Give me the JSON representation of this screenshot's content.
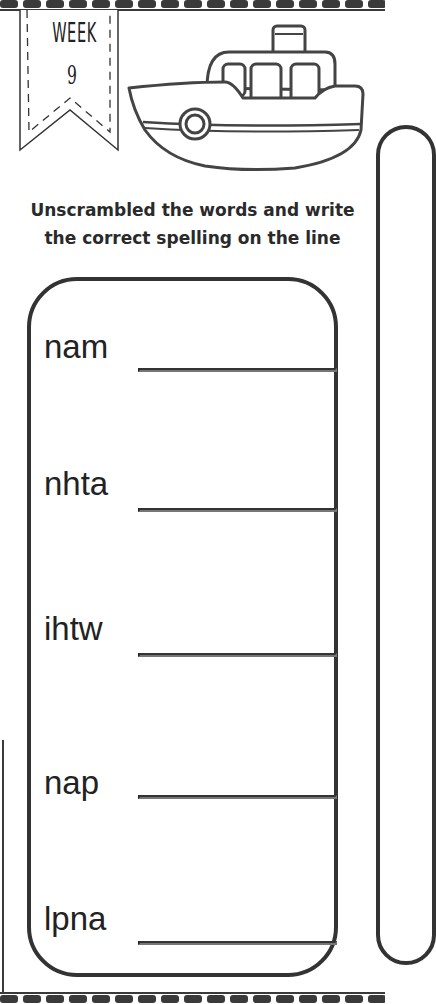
{
  "worksheet": {
    "banner": {
      "week_label": "WEEK",
      "week_number": "9"
    },
    "illustration": {
      "icon": "boat-icon"
    },
    "instructions": {
      "line1": "Unscrambled the words and write",
      "line2": "the correct spelling on the line"
    },
    "words": [
      {
        "scrambled": "nam",
        "answer": ""
      },
      {
        "scrambled": "nhta",
        "answer": ""
      },
      {
        "scrambled": "ihtw",
        "answer": ""
      },
      {
        "scrambled": "nap",
        "answer": ""
      },
      {
        "scrambled": "lpna",
        "answer": ""
      }
    ],
    "colors": {
      "ink": "#333333",
      "background": "#ffffff"
    }
  }
}
